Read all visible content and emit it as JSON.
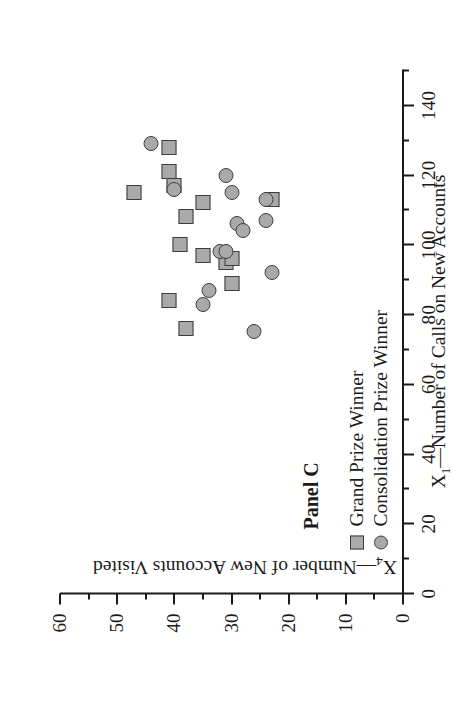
{
  "panel": {
    "title": "Panel C"
  },
  "legend": {
    "position": "inside-lower-left",
    "entries": [
      {
        "label": "Grand Prize Winner",
        "marker": "square",
        "color": "#a9a9a9"
      },
      {
        "label": "Consolidation Prize Winner",
        "marker": "circle",
        "color": "#a9a9a9"
      }
    ]
  },
  "axis_titles": {
    "x_var": "X",
    "x_sub": "1",
    "x_rest": "—Number of Calls on New Accounts",
    "y_var": "X",
    "y_sub": "4",
    "y_rest": "—Number of New Accounts Visited"
  },
  "chart_data": {
    "type": "scatter",
    "title": "Panel C",
    "xlabel": "X1—Number of Calls on New Accounts",
    "ylabel": "X4—Number of New Accounts Visited",
    "xlim": [
      0,
      150
    ],
    "ylim": [
      0,
      60
    ],
    "xticks": [
      0,
      20,
      40,
      60,
      80,
      100,
      120,
      140
    ],
    "yticks": [
      0,
      10,
      20,
      30,
      40,
      50,
      60
    ],
    "xtick_labels": [
      "0",
      "20",
      "40",
      "60",
      "80",
      "100",
      "120",
      "140"
    ],
    "ytick_labels": [
      "0",
      "10",
      "20",
      "30",
      "40",
      "50",
      "60"
    ],
    "xminor_step": 10,
    "yminor_step": 5,
    "grid": false,
    "marker_fill": "#a9a9a9",
    "marker_edge": "#3d3d3d",
    "series": [
      {
        "name": "Grand Prize Winner",
        "marker": "square",
        "points": [
          [
            128,
            41
          ],
          [
            121,
            41
          ],
          [
            115,
            47
          ],
          [
            117,
            40
          ],
          [
            112,
            35
          ],
          [
            108,
            38
          ],
          [
            113,
            23
          ],
          [
            100,
            39
          ],
          [
            97,
            35
          ],
          [
            95,
            31
          ],
          [
            89,
            30
          ],
          [
            84,
            41
          ],
          [
            96,
            30
          ],
          [
            76,
            38
          ]
        ]
      },
      {
        "name": "Consolidation Prize Winner",
        "marker": "circle",
        "points": [
          [
            129,
            44
          ],
          [
            120,
            31
          ],
          [
            116,
            40
          ],
          [
            115,
            30
          ],
          [
            113,
            24
          ],
          [
            107,
            24
          ],
          [
            106,
            29
          ],
          [
            104,
            28
          ],
          [
            98,
            32
          ],
          [
            98,
            31
          ],
          [
            92,
            23
          ],
          [
            87,
            34
          ],
          [
            83,
            35
          ],
          [
            75,
            26
          ]
        ]
      }
    ]
  }
}
